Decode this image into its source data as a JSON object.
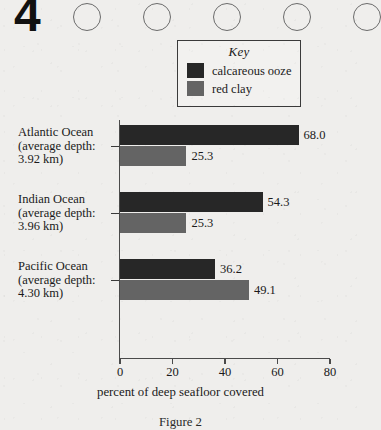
{
  "header": {
    "question_number": "4",
    "bubble_count": 5
  },
  "legend": {
    "title": "Key",
    "items": [
      {
        "label": "calcareous ooze",
        "color": "#272727"
      },
      {
        "label": "red clay",
        "color": "#646464"
      }
    ]
  },
  "axis_title": "percent of deep seafloor covered",
  "figure_caption": "Figure 2",
  "chart_data": {
    "type": "bar",
    "orientation": "horizontal",
    "title": "",
    "xlabel": "percent of deep seafloor covered",
    "ylabel": "",
    "xlim": [
      0,
      80
    ],
    "xticks": [
      0,
      20,
      40,
      60,
      80
    ],
    "xtick_labels": [
      "0",
      "20",
      "40",
      "60",
      "80"
    ],
    "grid": false,
    "legend_position": "top-right",
    "categories": [
      "Atlantic Ocean (average depth: 3.92 km)",
      "Indian Ocean (average depth: 3.96 km)",
      "Pacific Ocean (average depth: 4.30 km)"
    ],
    "category_lines": [
      [
        "Atlantic Ocean",
        "(average depth:",
        "3.92 km)"
      ],
      [
        "Indian Ocean",
        "(average depth:",
        "3.96 km)"
      ],
      [
        "Pacific Ocean",
        "(average depth:",
        "4.30 km)"
      ]
    ],
    "series": [
      {
        "name": "calcareous ooze",
        "color": "#272727",
        "values": [
          68.0,
          54.3,
          36.2
        ],
        "labels": [
          "68.0",
          "54.3",
          "36.2"
        ]
      },
      {
        "name": "red clay",
        "color": "#646464",
        "values": [
          25.3,
          25.3,
          49.1
        ],
        "labels": [
          "25.3",
          "25.3",
          "49.1"
        ]
      }
    ]
  }
}
